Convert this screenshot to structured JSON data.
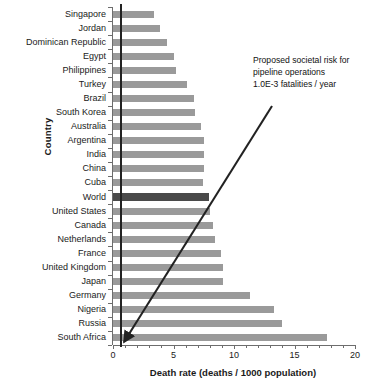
{
  "chart_data": {
    "type": "bar",
    "orientation": "horizontal",
    "title": "",
    "xlabel": "Death rate (deaths / 1000 population)",
    "ylabel": "Country",
    "xlim": [
      0,
      20
    ],
    "xticks": [
      0,
      5,
      10,
      15,
      20
    ],
    "xtick_labels": [
      "0",
      "5",
      "10",
      "15",
      "20"
    ],
    "grid": false,
    "legend": false,
    "categories": [
      "Singapore",
      "Jordan",
      "Dominican Republic",
      "Egypt",
      "Philippines",
      "Turkey",
      "Brazil",
      "South Korea",
      "Australia",
      "Argentina",
      "India",
      "China",
      "Cuba",
      "World",
      "United States",
      "Canada",
      "Netherlands",
      "France",
      "United Kingdom",
      "Japan",
      "Germany",
      "Nigeria",
      "Russia",
      "South Africa"
    ],
    "values": [
      3.4,
      3.9,
      4.5,
      5.0,
      5.2,
      6.1,
      6.7,
      6.8,
      7.3,
      7.5,
      7.5,
      7.5,
      7.4,
      7.9,
      8.0,
      8.3,
      8.4,
      8.9,
      9.1,
      9.1,
      11.3,
      13.3,
      14.0,
      17.7
    ],
    "highlight_category": "World",
    "colors": {
      "bar": "#9a9a9a",
      "highlight_bar": "#4a4a4a",
      "reference_line": "#222222",
      "annotation_line": "#222222",
      "axis": "#6d6d6d"
    },
    "annotations": [
      {
        "name": "proposed-societal-risk",
        "lines": [
          "Proposed societal risk for",
          "pipeline operations",
          "1.0E-3 fatalities / year"
        ],
        "pointer_value": 0.6
      }
    ],
    "reference_line": {
      "value": 0.6,
      "label": ""
    }
  }
}
